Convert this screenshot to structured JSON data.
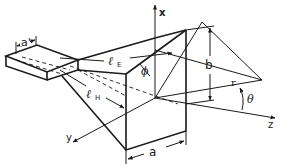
{
  "figure": {
    "labels": {
      "waveguide_width": "a'",
      "e_plane_length": "ℓ",
      "e_plane_sub": "E",
      "h_plane_length": "ℓ",
      "h_plane_sub": "H",
      "aperture_height": "b",
      "aperture_width": "a",
      "radius": "r",
      "elevation_angle": "θ",
      "azimuth_angle": "ϕ",
      "x_axis": "x",
      "y_axis": "y",
      "z_axis": "z"
    },
    "colors": {
      "ink": "#1a1a1a",
      "background": "#ffffff"
    }
  }
}
